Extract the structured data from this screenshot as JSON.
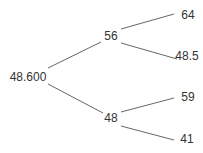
{
  "tree": {
    "root": {
      "label": "48.600"
    },
    "level1": [
      {
        "label": "56"
      },
      {
        "label": "48"
      }
    ],
    "leaves": [
      {
        "label": "64",
        "parent": "56"
      },
      {
        "label": "48.5",
        "parent": "56"
      },
      {
        "label": "59",
        "parent": "48"
      },
      {
        "label": "41",
        "parent": "48"
      }
    ]
  },
  "style": {
    "line_color": "#555555",
    "text_color": "#333333"
  }
}
